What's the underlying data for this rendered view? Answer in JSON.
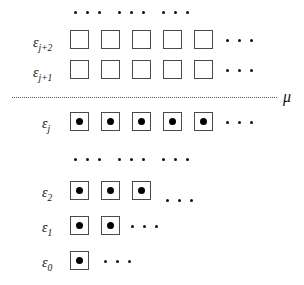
{
  "figure": {
    "type": "energy-level-occupancy-diagram",
    "chemical_potential": {
      "label": "μ",
      "name": "mu"
    },
    "box_size_px": 19,
    "levels": [
      {
        "id": "eps-j-plus-2",
        "symbol": "ε",
        "subscript": "j+2",
        "label_x": 33,
        "label_y": 34,
        "row_y": 30,
        "boxes": [
          {
            "x": 70,
            "filled": false
          },
          {
            "x": 101,
            "filled": false
          },
          {
            "x": 132,
            "filled": false
          },
          {
            "x": 163,
            "filled": false
          },
          {
            "x": 194,
            "filled": false
          }
        ],
        "trailing_dots": [
          226,
          238,
          250
        ],
        "trailing_dots_y": 39
      },
      {
        "id": "eps-j-plus-1",
        "symbol": "ε",
        "subscript": "j+1",
        "label_x": 33,
        "label_y": 64,
        "row_y": 60,
        "boxes": [
          {
            "x": 70,
            "filled": false
          },
          {
            "x": 101,
            "filled": false
          },
          {
            "x": 132,
            "filled": false
          },
          {
            "x": 163,
            "filled": false
          },
          {
            "x": 194,
            "filled": false
          }
        ],
        "trailing_dots": [
          226,
          238,
          250
        ],
        "trailing_dots_y": 69
      },
      {
        "id": "eps-j",
        "symbol": "ε",
        "subscript": "j",
        "label_x": 42,
        "label_y": 115,
        "row_y": 112,
        "boxes": [
          {
            "x": 70,
            "filled": true
          },
          {
            "x": 101,
            "filled": true
          },
          {
            "x": 132,
            "filled": true
          },
          {
            "x": 163,
            "filled": true
          },
          {
            "x": 194,
            "filled": true
          }
        ],
        "trailing_dots": [
          226,
          238,
          250
        ],
        "trailing_dots_y": 121
      },
      {
        "id": "eps-2",
        "symbol": "ε",
        "subscript": "2",
        "label_x": 42,
        "label_y": 184,
        "row_y": 181,
        "boxes": [
          {
            "x": 70,
            "filled": true
          },
          {
            "x": 101,
            "filled": true
          },
          {
            "x": 132,
            "filled": true
          }
        ],
        "trailing_dots": [
          166,
          178,
          190
        ],
        "trailing_dots_y": 199
      },
      {
        "id": "eps-1",
        "symbol": "ε",
        "subscript": "1",
        "label_x": 42,
        "label_y": 219,
        "row_y": 216,
        "boxes": [
          {
            "x": 70,
            "filled": true
          },
          {
            "x": 101,
            "filled": true
          }
        ],
        "trailing_dots": [
          131,
          143,
          155
        ],
        "trailing_dots_y": 225
      },
      {
        "id": "eps-0",
        "symbol": "ε",
        "subscript": "0",
        "label_x": 42,
        "label_y": 254,
        "row_y": 251,
        "boxes": [
          {
            "x": 70,
            "filled": true
          }
        ],
        "trailing_dots": [
          104,
          116,
          128
        ],
        "trailing_dots_y": 260
      }
    ],
    "ellipsis_rows": [
      {
        "id": "top-ellipsis",
        "y": 11,
        "dots": [
          74,
          86,
          98,
          118,
          130,
          142,
          162,
          174,
          186
        ]
      },
      {
        "id": "middle-ellipsis",
        "y": 158,
        "dots": [
          74,
          86,
          98,
          118,
          130,
          142,
          162,
          174,
          186
        ]
      }
    ],
    "mu_line": {
      "x": 12,
      "y": 97,
      "width": 265
    },
    "mu_label": {
      "x": 283,
      "y": 89,
      "text": "μ"
    }
  }
}
